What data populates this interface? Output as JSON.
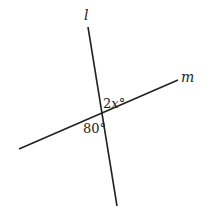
{
  "diagram": {
    "lines": [
      {
        "name": "l",
        "label": "l",
        "x1": 88,
        "y1": 27,
        "x2": 117,
        "y2": 206
      },
      {
        "name": "m",
        "label": "m",
        "x1": 19,
        "y1": 149,
        "x2": 178,
        "y2": 80
      }
    ],
    "angles": {
      "upper_right": {
        "label_coef": "2",
        "label_var": "x",
        "label_deg": "°"
      },
      "lower_left": {
        "label": "80°"
      }
    },
    "colors": {
      "line": "#222222",
      "text": "#222222"
    }
  }
}
